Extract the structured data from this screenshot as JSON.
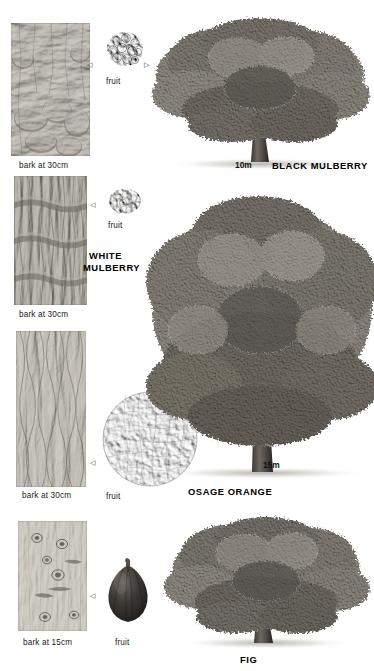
{
  "page": {
    "background_color": "#ffffff",
    "ink_color": "#1a1a1a",
    "width": 374,
    "height": 671
  },
  "entries": [
    {
      "id": "black-mulberry",
      "common_name": "BLACK MULBERRY",
      "name_lines": [
        "BLACK MULBERRY"
      ],
      "bark_caption": "bark at 30cm",
      "fruit_caption": "fruit",
      "scale_label": "10m",
      "fruit_type": "aggregate-drupe",
      "fruit_tone": "#2e2b29",
      "bark_texture": "knobby-burred-ridged",
      "tree_form": "broad-low-domed",
      "arrows": [
        "◁",
        "▷"
      ]
    },
    {
      "id": "white-mulberry",
      "common_name": "WHITE MULBERRY",
      "name_lines": [
        "WHITE",
        "MULBERRY"
      ],
      "bark_caption": "bark at 30cm",
      "fruit_caption": "fruit",
      "scale_label": "",
      "fruit_type": "aggregate-drupe-pale",
      "fruit_tone": "#9a968d",
      "bark_texture": "vertical-fissured-banded",
      "tree_form": "",
      "arrows": [
        "◁"
      ]
    },
    {
      "id": "osage-orange",
      "common_name": "OSAGE ORANGE",
      "name_lines": [
        "OSAGE ORANGE"
      ],
      "bark_caption": "bark at 30cm",
      "fruit_caption": "fruit",
      "scale_label": "15m",
      "fruit_type": "large-warty-globe",
      "fruit_tone": "#b3afa6",
      "bark_texture": "stringy-interlaced-fibrous",
      "tree_form": "tall-spreading-central-leader",
      "arrows": [
        "◁"
      ]
    },
    {
      "id": "fig",
      "common_name": "FIG",
      "name_lines": [
        "FIG"
      ],
      "bark_caption": "bark at 15cm",
      "fruit_caption": "fruit",
      "scale_label": "",
      "fruit_type": "pyriform-syconium",
      "fruit_tone": "#3a3733",
      "bark_texture": "smooth-with-branch-scars",
      "tree_form": "broad-low-spreading",
      "arrows": [
        "◁"
      ]
    }
  ]
}
